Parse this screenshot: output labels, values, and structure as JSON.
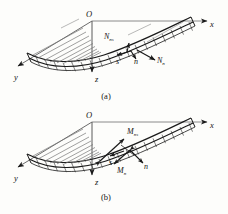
{
  "figure": {
    "background_color": "#fdfdfb",
    "line_color": "#1a1a1a",
    "panels": [
      {
        "id": "panel-a",
        "caption": "(a)",
        "origin_label": "O",
        "axes": [
          {
            "name": "x-axis",
            "label": "x"
          },
          {
            "name": "y-axis",
            "label": "y"
          },
          {
            "name": "z-axis",
            "label": "z"
          }
        ],
        "direction_vectors": [
          {
            "name": "s-vector",
            "label": "s"
          },
          {
            "name": "n-vector",
            "label": "n"
          }
        ],
        "force_labels": [
          {
            "name": "shear-force-ns",
            "base": "N",
            "sub": "ns"
          },
          {
            "name": "normal-force-n",
            "base": "N",
            "sub": "n"
          }
        ]
      },
      {
        "id": "panel-b",
        "caption": "(b)",
        "origin_label": "O",
        "axes": [
          {
            "name": "x-axis",
            "label": "x"
          },
          {
            "name": "y-axis",
            "label": "y"
          },
          {
            "name": "z-axis",
            "label": "z"
          }
        ],
        "direction_vectors": [
          {
            "name": "s-vector",
            "label": "s"
          },
          {
            "name": "n-vector",
            "label": "n"
          }
        ],
        "moment_labels": [
          {
            "name": "twisting-moment-ns",
            "base": "M",
            "sub": "ns"
          },
          {
            "name": "bending-moment-n",
            "base": "M",
            "sub": "n"
          }
        ]
      }
    ]
  }
}
